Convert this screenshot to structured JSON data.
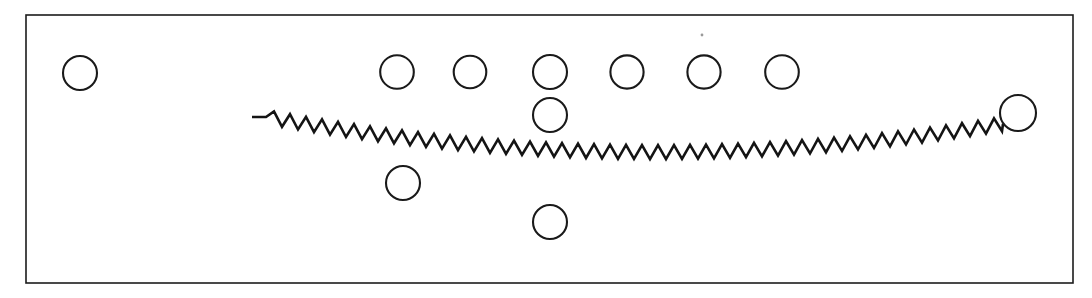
{
  "figure": {
    "domain_type": "diagram",
    "canvas": {
      "width": 1092,
      "height": 298
    },
    "background_color": "#ffffff",
    "line_color": "#1a1a1a",
    "fill_color": "#ffffff",
    "frame": {
      "name": "outer-frame",
      "x": 26,
      "y": 15,
      "width": 1047,
      "height": 268,
      "stroke": "#1c1c1c",
      "stroke_width": 1.6,
      "fill": "none"
    },
    "circles": [
      {
        "label": "circle-1",
        "cx": 80,
        "cy": 73,
        "r": 17.0,
        "row": "top-left-isolated"
      },
      {
        "label": "circle-2",
        "cx": 397,
        "cy": 72,
        "r": 16.8,
        "row": "top-row"
      },
      {
        "label": "circle-3",
        "cx": 470,
        "cy": 72,
        "r": 16.3,
        "row": "top-row"
      },
      {
        "label": "circle-4",
        "cx": 550,
        "cy": 72,
        "r": 17.0,
        "row": "top-row"
      },
      {
        "label": "circle-5",
        "cx": 627,
        "cy": 72,
        "r": 16.6,
        "row": "top-row"
      },
      {
        "label": "circle-6",
        "cx": 704,
        "cy": 72,
        "r": 16.6,
        "row": "top-row"
      },
      {
        "label": "circle-7",
        "cx": 782,
        "cy": 72,
        "r": 16.8,
        "row": "top-row"
      },
      {
        "label": "circle-8",
        "cx": 550,
        "cy": 115,
        "r": 17.0,
        "row": "second-row"
      },
      {
        "label": "circle-9",
        "cx": 403,
        "cy": 183,
        "r": 17.0,
        "row": "lower-left"
      },
      {
        "label": "circle-10",
        "cx": 550,
        "cy": 222,
        "r": 17.0,
        "row": "lower-center"
      },
      {
        "label": "circle-11",
        "cx": 1018,
        "cy": 113,
        "r": 18.0,
        "row": "right-terminus"
      }
    ],
    "zigzag": {
      "name": "zigzag-line",
      "stroke": "#141414",
      "stroke_width": 2.6,
      "start_x": 252,
      "start_y": 117,
      "end_x": 1003,
      "end_y": 124,
      "flat_lead_length": 14,
      "period": 16,
      "amplitude": 7,
      "mid_sag_y": 152,
      "note": "sawtooth waveform that dips to a shallow minimum near the middle then rises to meet the right terminus circle"
    },
    "speck": {
      "name": "dust-speck",
      "cx": 702,
      "cy": 35,
      "r": 1.4,
      "color": "#9a9a9a"
    }
  }
}
